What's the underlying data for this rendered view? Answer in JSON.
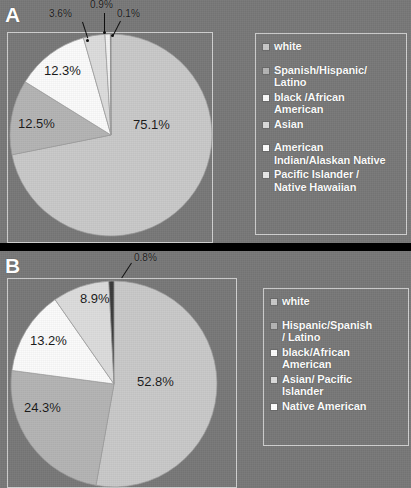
{
  "figure": {
    "background_color": "#787878",
    "outer_color": "#000000",
    "colors": {
      "white_slice": "#c9c9c9",
      "hispanic_slice": "#b4b4b4",
      "black_slice": "#fbfbfb",
      "asian_slice": "#dcdcdc",
      "american_indian_slice": "#f2f2f2",
      "pacific_islander_slice": "#3a3a3a",
      "frame": "#cfcfcf",
      "label_text": "#1b1b1b",
      "legend_text": "#ffffff"
    }
  },
  "panels": [
    {
      "letter": "A",
      "legend": [
        {
          "label": "white",
          "swatch": "#c9c9c9",
          "gap": false
        },
        {
          "label": "Spanish/Hispanic/\nLatino",
          "swatch": "#b4b4b4",
          "gap": true
        },
        {
          "label": "black /African\nAmerican",
          "swatch": "#fbfbfb",
          "gap": false
        },
        {
          "label": "Asian",
          "swatch": "#dcdcdc",
          "gap": false
        },
        {
          "label": "American\nIndian/Alaskan Native",
          "swatch": "#ffffff",
          "gap": true
        },
        {
          "label": "Pacific Islander /\nNative Hawaiian",
          "swatch": "#e8e8e8",
          "gap": false
        }
      ],
      "labels": [
        {
          "text": "75.1%",
          "size": "big"
        },
        {
          "text": "12.5%",
          "size": "big"
        },
        {
          "text": "12.3%",
          "size": "big"
        },
        {
          "text": "3.6%",
          "size": "small"
        },
        {
          "text": "0.9%",
          "size": "small"
        },
        {
          "text": "0.1%",
          "size": "small"
        }
      ]
    },
    {
      "letter": "B",
      "legend": [
        {
          "label": "white",
          "swatch": "#c9c9c9",
          "gap": false
        },
        {
          "label": "Hispanic/Spanish\n/ Latino",
          "swatch": "#b4b4b4",
          "gap": true
        },
        {
          "label": "black/African\nAmerican",
          "swatch": "#fbfbfb",
          "gap": false
        },
        {
          "label": "Asian/ Pacific\nIslander",
          "swatch": "#dcdcdc",
          "gap": false
        },
        {
          "label": "Native American",
          "swatch": "#ffffff",
          "gap": false
        }
      ],
      "labels": [
        {
          "text": "52.8%",
          "size": "big"
        },
        {
          "text": "24.3%",
          "size": "big"
        },
        {
          "text": "13.2%",
          "size": "big"
        },
        {
          "text": "8.9%",
          "size": "big"
        },
        {
          "text": "0.8%",
          "size": "small"
        }
      ]
    }
  ],
  "chart_data": [
    {
      "type": "pie",
      "title": "A",
      "panel": "A",
      "start_angle_deg": 0,
      "direction": "clockwise",
      "categories": [
        "white",
        "Spanish/Hispanic/Latino",
        "black /African American",
        "Asian",
        "American Indian/Alaskan Native",
        "Pacific Islander / Native Hawaiian"
      ],
      "values": [
        75.1,
        12.5,
        12.3,
        3.6,
        0.9,
        0.1
      ],
      "units": "percent",
      "labels": [
        "75.1%",
        "12.5%",
        "12.3%",
        "3.6%",
        "0.9%",
        "0.1%"
      ],
      "colors": [
        "#c9c9c9",
        "#b4b4b4",
        "#fbfbfb",
        "#dcdcdc",
        "#f2f2f2",
        "#3a3a3a"
      ],
      "legend_position": "right",
      "grid": false
    },
    {
      "type": "pie",
      "title": "B",
      "panel": "B",
      "start_angle_deg": 0,
      "direction": "clockwise",
      "categories": [
        "white",
        "Hispanic/Spanish / Latino",
        "black/African American",
        "Asian/ Pacific Islander",
        "Native American"
      ],
      "values": [
        52.8,
        24.3,
        13.2,
        8.9,
        0.8
      ],
      "units": "percent",
      "labels": [
        "52.8%",
        "24.3%",
        "13.2%",
        "8.9%",
        "0.8%"
      ],
      "colors": [
        "#c9c9c9",
        "#b4b4b4",
        "#fbfbfb",
        "#dcdcdc",
        "#3a3a3a"
      ],
      "legend_position": "right",
      "grid": false
    }
  ]
}
